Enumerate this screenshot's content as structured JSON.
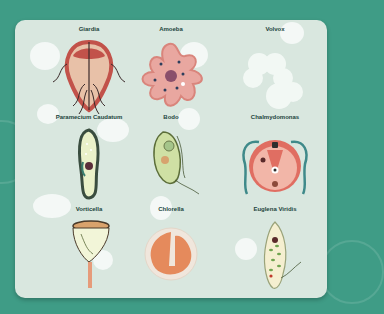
{
  "colors": {
    "background": "#3f9c86",
    "card": "#d9e7df",
    "blob": "#f6faf8"
  },
  "organisms": [
    {
      "name": "Giardia"
    },
    {
      "name": "Amoeba"
    },
    {
      "name": "Volvox"
    },
    {
      "name": "Paramecium Caudatum"
    },
    {
      "name": "Bodo"
    },
    {
      "name": "Chalmydomonas"
    },
    {
      "name": "Vorticella"
    },
    {
      "name": "Chlorella"
    },
    {
      "name": "Euglena Viridis"
    }
  ]
}
